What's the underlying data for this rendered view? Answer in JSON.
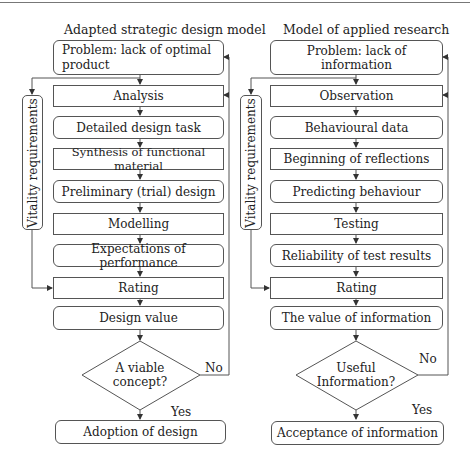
{
  "left": {
    "title": "Adapted strategic design model",
    "problem": "Problem: lack of optimal product",
    "steps": [
      "Analysis",
      "Detailed design task",
      "Synthesis of functional material",
      "Preliminary (trial) design",
      "Modelling",
      "Expectations of performance",
      "Rating",
      "Design value"
    ],
    "side": "Vitality requirements",
    "decision": "A viable concept?",
    "no_label": "No",
    "yes_label": "Yes",
    "outcome": "Adoption of design"
  },
  "right": {
    "title": "Model of applied research",
    "problem": "Problem: lack of information",
    "steps": [
      "Observation",
      "Behavioural data",
      "Beginning of reflections",
      "Predicting behaviour",
      "Testing",
      "Reliability of test results",
      "Rating",
      "The value of information"
    ],
    "side": "Vitality requirements",
    "decision": "Useful Information?",
    "no_label": "No",
    "yes_label": "Yes",
    "outcome": "Acceptance of information"
  }
}
